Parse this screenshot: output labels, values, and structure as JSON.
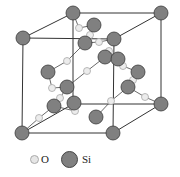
{
  "figure": {
    "legend": [
      {
        "symbol": "O",
        "label": "O",
        "color": "#e6e6e6"
      },
      {
        "symbol": "Si",
        "label": "Si",
        "color": "#808080"
      }
    ],
    "colors": {
      "si_fill": "#808080",
      "si_stroke": "#3a3a3a",
      "o_fill": "#ececec",
      "o_stroke": "#a8a8a8",
      "edge": "#333333"
    },
    "cube": {
      "front": [
        [
          23,
          38
        ],
        [
          114,
          39
        ],
        [
          113,
          133
        ],
        [
          22,
          133
        ]
      ],
      "back": [
        [
          73,
          13
        ],
        [
          161,
          13
        ],
        [
          161,
          104
        ],
        [
          73,
          104
        ]
      ]
    },
    "si_atoms": [
      [
        73,
        13
      ],
      [
        161,
        13
      ],
      [
        23,
        38
      ],
      [
        114,
        39
      ],
      [
        161,
        104
      ],
      [
        22,
        133
      ],
      [
        113,
        133
      ],
      [
        94,
        25
      ],
      [
        85,
        43
      ],
      [
        105,
        57
      ],
      [
        118,
        59
      ],
      [
        138,
        72
      ],
      [
        48,
        72
      ],
      [
        67,
        87
      ],
      [
        128,
        87
      ],
      [
        54,
        106
      ],
      [
        74,
        103
      ],
      [
        96,
        117
      ]
    ],
    "o_atoms": [
      [
        79,
        28
      ],
      [
        90,
        35
      ],
      [
        99,
        42
      ],
      [
        109,
        51
      ],
      [
        67,
        61
      ],
      [
        87,
        71
      ],
      [
        123,
        66
      ],
      [
        133,
        80
      ],
      [
        52,
        88
      ],
      [
        60,
        98
      ],
      [
        75,
        111
      ],
      [
        39,
        118
      ],
      [
        111,
        101
      ],
      [
        145,
        97
      ]
    ]
  }
}
